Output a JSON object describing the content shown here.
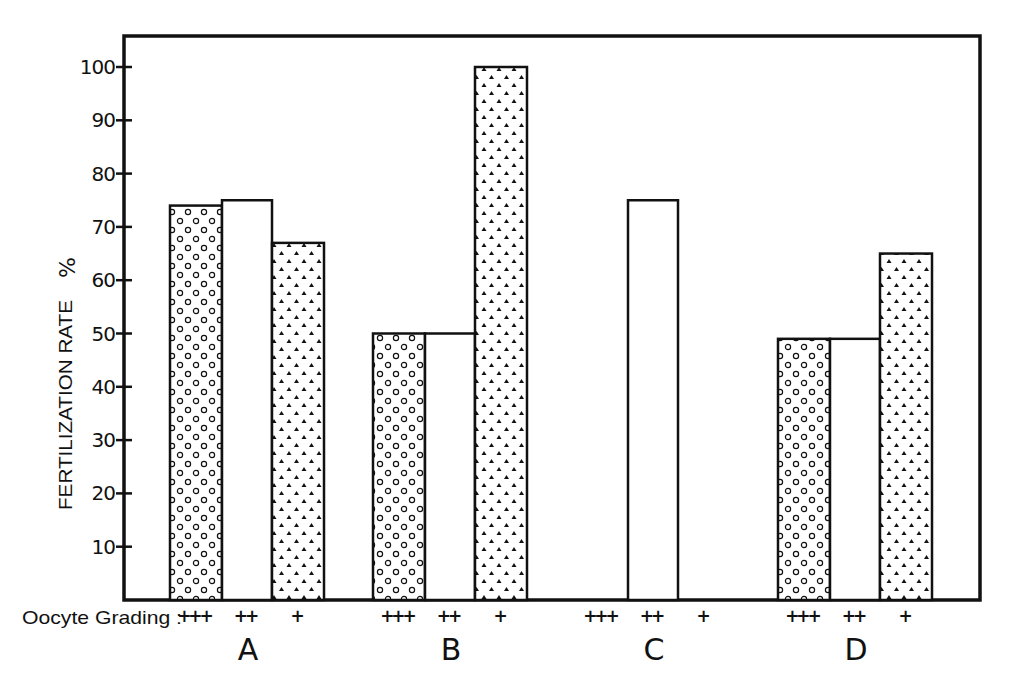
{
  "chart_data": {
    "type": "bar",
    "title": "",
    "xlabel": "Oocyte Grading :",
    "ylabel": "FERTILIZATION RATE %",
    "ylim": [
      0,
      105
    ],
    "yticks": [
      10,
      20,
      30,
      40,
      50,
      60,
      70,
      80,
      90,
      100
    ],
    "grid": false,
    "legend": "none (pattern indicates grade: circles = +++, blank = ++, triangles = +)",
    "groups": [
      "A",
      "B",
      "C",
      "D"
    ],
    "grades": [
      "+++",
      "++",
      "+"
    ],
    "series": [
      {
        "name": "+++",
        "pattern": "circles",
        "values": [
          74,
          50,
          0,
          49
        ]
      },
      {
        "name": "++",
        "pattern": "blank",
        "values": [
          75,
          50,
          75,
          49
        ]
      },
      {
        "name": "+",
        "pattern": "triangles",
        "values": [
          67,
          100,
          0,
          65
        ]
      }
    ]
  },
  "axis": {
    "x_prefix": "Oocyte Grading :",
    "y_label_main": "FERTILIZATION RATE",
    "y_label_unit": "%"
  }
}
